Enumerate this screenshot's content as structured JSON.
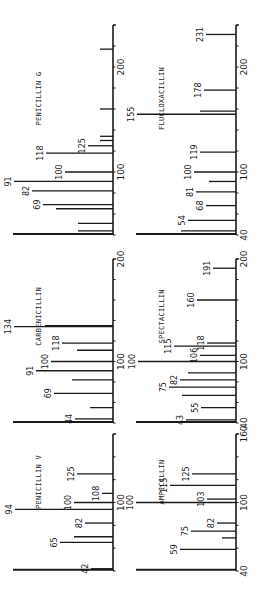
{
  "chart_data": [
    {
      "type": "bar",
      "title": "PENICILLIN G",
      "orientation": "rotated-90",
      "xlabel": "m/z",
      "ylabel": "relative intensity",
      "xlim": [
        40,
        240
      ],
      "tick_labels": [
        "100",
        "200"
      ],
      "peaks": [
        {
          "mz": 41,
          "intensity": 100,
          "label": ""
        },
        {
          "mz": 44,
          "intensity": 35,
          "label": ""
        },
        {
          "mz": 51,
          "intensity": 35,
          "label": ""
        },
        {
          "mz": 65,
          "intensity": 57,
          "label": ""
        },
        {
          "mz": 69,
          "intensity": 70,
          "label": "69"
        },
        {
          "mz": 82,
          "intensity": 81,
          "label": "82"
        },
        {
          "mz": 91,
          "intensity": 99,
          "label": "91"
        },
        {
          "mz": 100,
          "intensity": 48,
          "label": "100"
        },
        {
          "mz": 118,
          "intensity": 67,
          "label": "118"
        },
        {
          "mz": 125,
          "intensity": 25,
          "label": "125"
        },
        {
          "mz": 130,
          "intensity": 13,
          "label": ""
        },
        {
          "mz": 134,
          "intensity": 13,
          "label": ""
        },
        {
          "mz": 160,
          "intensity": 13,
          "label": ""
        },
        {
          "mz": 217,
          "intensity": 13,
          "label": ""
        }
      ]
    },
    {
      "type": "bar",
      "title": "FLUCLOXACILLIN",
      "orientation": "rotated-90",
      "xlabel": "m/z",
      "ylabel": "relative intensity",
      "xlim": [
        40,
        240
      ],
      "tick_labels": [
        "40",
        "100",
        "200"
      ],
      "peaks": [
        {
          "mz": 41,
          "intensity": 100,
          "label": ""
        },
        {
          "mz": 44,
          "intensity": 55,
          "label": ""
        },
        {
          "mz": 54,
          "intensity": 48,
          "label": "54"
        },
        {
          "mz": 68,
          "intensity": 30,
          "label": "68"
        },
        {
          "mz": 81,
          "intensity": 40,
          "label": "81"
        },
        {
          "mz": 91,
          "intensity": 27,
          "label": ""
        },
        {
          "mz": 100,
          "intensity": 42,
          "label": "100"
        },
        {
          "mz": 119,
          "intensity": 36,
          "label": "119"
        },
        {
          "mz": 155,
          "intensity": 99,
          "label": "155"
        },
        {
          "mz": 158,
          "intensity": 36,
          "label": ""
        },
        {
          "mz": 178,
          "intensity": 32,
          "label": "178"
        },
        {
          "mz": 231,
          "intensity": 30,
          "label": "231"
        }
      ]
    },
    {
      "type": "bar",
      "title": "CARBENICILLIN",
      "orientation": "rotated-90",
      "xlabel": "m/z",
      "ylabel": "relative intensity",
      "xlim": [
        40,
        200
      ],
      "tick_labels": [
        "100",
        "200"
      ],
      "peaks": [
        {
          "mz": 41,
          "intensity": 100,
          "label": ""
        },
        {
          "mz": 44,
          "intensity": 38,
          "label": "44"
        },
        {
          "mz": 55,
          "intensity": 23,
          "label": ""
        },
        {
          "mz": 69,
          "intensity": 59,
          "label": "69"
        },
        {
          "mz": 82,
          "intensity": 41,
          "label": ""
        },
        {
          "mz": 91,
          "intensity": 77,
          "label": "91"
        },
        {
          "mz": 100,
          "intensity": 62,
          "label": "100"
        },
        {
          "mz": 111,
          "intensity": 36,
          "label": ""
        },
        {
          "mz": 118,
          "intensity": 51,
          "label": "118"
        },
        {
          "mz": 134,
          "intensity": 99,
          "label": "134"
        },
        {
          "mz": 135,
          "intensity": 68,
          "label": ""
        }
      ]
    },
    {
      "type": "bar",
      "title": "SPECTACILLIN",
      "orientation": "rotated-90",
      "xlabel": "m/z",
      "ylabel": "relative intensity",
      "xlim": [
        40,
        200
      ],
      "tick_labels": [
        "40",
        "100",
        "200"
      ],
      "peaks": [
        {
          "mz": 41,
          "intensity": 100,
          "label": ""
        },
        {
          "mz": 43,
          "intensity": 50,
          "label": "43"
        },
        {
          "mz": 55,
          "intensity": 35,
          "label": "55"
        },
        {
          "mz": 67,
          "intensity": 54,
          "label": ""
        },
        {
          "mz": 75,
          "intensity": 67,
          "label": "75"
        },
        {
          "mz": 82,
          "intensity": 56,
          "label": "82"
        },
        {
          "mz": 89,
          "intensity": 48,
          "label": ""
        },
        {
          "mz": 100,
          "intensity": 98,
          "label": "100"
        },
        {
          "mz": 106,
          "intensity": 36,
          "label": "106"
        },
        {
          "mz": 115,
          "intensity": 62,
          "label": "115"
        },
        {
          "mz": 118,
          "intensity": 29,
          "label": "118"
        },
        {
          "mz": 160,
          "intensity": 39,
          "label": "160"
        },
        {
          "mz": 191,
          "intensity": 23,
          "label": "191"
        }
      ]
    },
    {
      "type": "bar",
      "title": "PENICILLIN V",
      "orientation": "rotated-90",
      "xlabel": "m/z",
      "ylabel": "relative intensity",
      "xlim": [
        40,
        160
      ],
      "tick_labels": [
        "100"
      ],
      "peaks": [
        {
          "mz": 41,
          "intensity": 100,
          "label": ""
        },
        {
          "mz": 42,
          "intensity": 22,
          "label": "42"
        },
        {
          "mz": 65,
          "intensity": 53,
          "label": "65"
        },
        {
          "mz": 70,
          "intensity": 39,
          "label": ""
        },
        {
          "mz": 82,
          "intensity": 28,
          "label": "82"
        },
        {
          "mz": 94,
          "intensity": 98,
          "label": "94"
        },
        {
          "mz": 100,
          "intensity": 39,
          "label": "100"
        },
        {
          "mz": 108,
          "intensity": 11,
          "label": "108"
        },
        {
          "mz": 125,
          "intensity": 36,
          "label": "125"
        }
      ]
    },
    {
      "type": "bar",
      "title": "AMPICILLIN",
      "orientation": "rotated-90",
      "xlabel": "m/z",
      "ylabel": "relative intensity",
      "xlim": [
        40,
        160
      ],
      "tick_labels": [
        "40",
        "100",
        "160"
      ],
      "peaks": [
        {
          "mz": 41,
          "intensity": 100,
          "label": ""
        },
        {
          "mz": 59,
          "intensity": 56,
          "label": "59"
        },
        {
          "mz": 69,
          "intensity": 14,
          "label": ""
        },
        {
          "mz": 75,
          "intensity": 45,
          "label": "75"
        },
        {
          "mz": 82,
          "intensity": 19,
          "label": "82"
        },
        {
          "mz": 100,
          "intensity": 100,
          "label": "100"
        },
        {
          "mz": 103,
          "intensity": 29,
          "label": "103"
        },
        {
          "mz": 115,
          "intensity": 66,
          "label": "115"
        },
        {
          "mz": 125,
          "intensity": 44,
          "label": "125"
        }
      ]
    }
  ],
  "layout": {
    "columns": [
      {
        "axis_x": 113,
        "max_len": 100
      },
      {
        "axis_x": 236,
        "max_len": 100
      }
    ],
    "rows": [
      {
        "y_top": 25,
        "y_base": 235,
        "mz_min": 40,
        "mz_max": 240
      },
      {
        "y_top": 259,
        "y_base": 423,
        "mz_min": 40,
        "mz_max": 200
      },
      {
        "y_top": 434,
        "y_base": 571,
        "mz_min": 40,
        "mz_max": 160
      }
    ],
    "ink_color": "#1a1a1a"
  }
}
